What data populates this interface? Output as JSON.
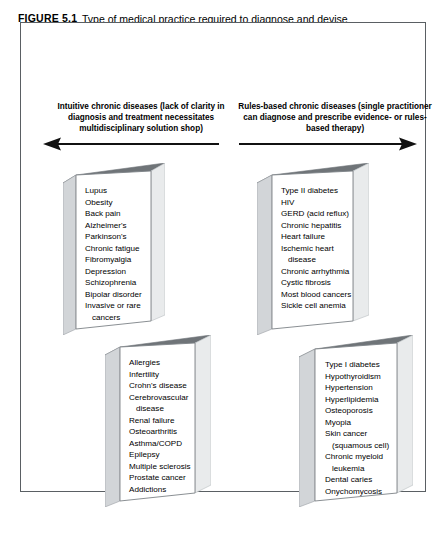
{
  "caption": {
    "label": "FIGURE 5.1",
    "text": "Type of medical practice required to diagnose and devise therapy for a range of chronic diseases"
  },
  "columns": {
    "left": {
      "header": "Intuitive chronic diseases (lack of clarity in diagnosis and treatment necessitates multidisciplinary solution shop)",
      "arrow_direction": "left",
      "boxes": [
        {
          "name": "left-upper-box",
          "items": [
            {
              "text": "Lupus",
              "continuation": false
            },
            {
              "text": "Obesity",
              "continuation": false
            },
            {
              "text": "Back pain",
              "continuation": false
            },
            {
              "text": "Alzheimer's",
              "continuation": false
            },
            {
              "text": "Parkinson's",
              "continuation": false
            },
            {
              "text": "Chronic fatigue",
              "continuation": false
            },
            {
              "text": "Fibromyalgia",
              "continuation": false
            },
            {
              "text": "Depression",
              "continuation": false
            },
            {
              "text": "Schizophrenia",
              "continuation": false
            },
            {
              "text": "Bipolar disorder",
              "continuation": false
            },
            {
              "text": "Invasive or rare",
              "continuation": false
            },
            {
              "text": "cancers",
              "continuation": true
            }
          ]
        },
        {
          "name": "left-lower-box",
          "items": [
            {
              "text": "Allergies",
              "continuation": false
            },
            {
              "text": "Infertility",
              "continuation": false
            },
            {
              "text": "Crohn's disease",
              "continuation": false
            },
            {
              "text": "Cerebrovascular",
              "continuation": false
            },
            {
              "text": "disease",
              "continuation": true
            },
            {
              "text": "Renal failure",
              "continuation": false
            },
            {
              "text": "Osteoarthritis",
              "continuation": false
            },
            {
              "text": "Asthma/COPD",
              "continuation": false
            },
            {
              "text": "Epilepsy",
              "continuation": false
            },
            {
              "text": "Multiple sclerosis",
              "continuation": false
            },
            {
              "text": "Prostate cancer",
              "continuation": false
            },
            {
              "text": "Addictions",
              "continuation": false
            }
          ]
        }
      ]
    },
    "right": {
      "header": "Rules-based chronic diseases (single practitioner can diagnose and prescribe evidence- or rules-based therapy)",
      "arrow_direction": "right",
      "boxes": [
        {
          "name": "right-upper-box",
          "items": [
            {
              "text": "Type II diabetes",
              "continuation": false
            },
            {
              "text": "HIV",
              "continuation": false
            },
            {
              "text": "GERD (acid reflux)",
              "continuation": false
            },
            {
              "text": "Chronic hepatitis",
              "continuation": false
            },
            {
              "text": "Heart failure",
              "continuation": false
            },
            {
              "text": "Ischemic heart",
              "continuation": false
            },
            {
              "text": "disease",
              "continuation": true
            },
            {
              "text": "Chronic arrhythmia",
              "continuation": false
            },
            {
              "text": "Cystic fibrosis",
              "continuation": false
            },
            {
              "text": "Most blood cancers",
              "continuation": false
            },
            {
              "text": "Sickle cell anemia",
              "continuation": false
            }
          ]
        },
        {
          "name": "right-lower-box",
          "items": [
            {
              "text": "Type I diabetes",
              "continuation": false
            },
            {
              "text": "Hypothyroidism",
              "continuation": false
            },
            {
              "text": "Hypertension",
              "continuation": false
            },
            {
              "text": "Hyperlipidemia",
              "continuation": false
            },
            {
              "text": "Osteoporosis",
              "continuation": false
            },
            {
              "text": "Myopia",
              "continuation": false
            },
            {
              "text": "Skin cancer",
              "continuation": false
            },
            {
              "text": "(squamous cell)",
              "continuation": true
            },
            {
              "text": "Chronic myeloid",
              "continuation": false
            },
            {
              "text": "leukemia",
              "continuation": true
            },
            {
              "text": "Dental caries",
              "continuation": false
            },
            {
              "text": "Onychomycosis",
              "continuation": false
            }
          ]
        }
      ]
    }
  },
  "colors": {
    "frame_border": "#5a5f63",
    "box_border": "#7d8287",
    "box_top_face": "#6f7478",
    "box_side_face": "#d2d5d8",
    "text": "#000000",
    "arrow": "#111111"
  }
}
